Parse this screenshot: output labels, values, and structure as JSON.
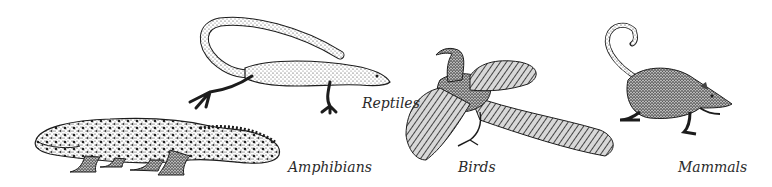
{
  "figure": {
    "background": "#ffffff",
    "ink_color": "#1c1c1c",
    "groups": [
      {
        "id": "amphibians",
        "label": "Amphibians",
        "subject": "salamander-icon"
      },
      {
        "id": "reptiles",
        "label": "Reptiles",
        "subject": "lizard-icon"
      },
      {
        "id": "birds",
        "label": "Birds",
        "subject": "archaeopteryx-icon"
      },
      {
        "id": "mammals",
        "label": "Mammals",
        "subject": "shrew-icon"
      }
    ]
  }
}
